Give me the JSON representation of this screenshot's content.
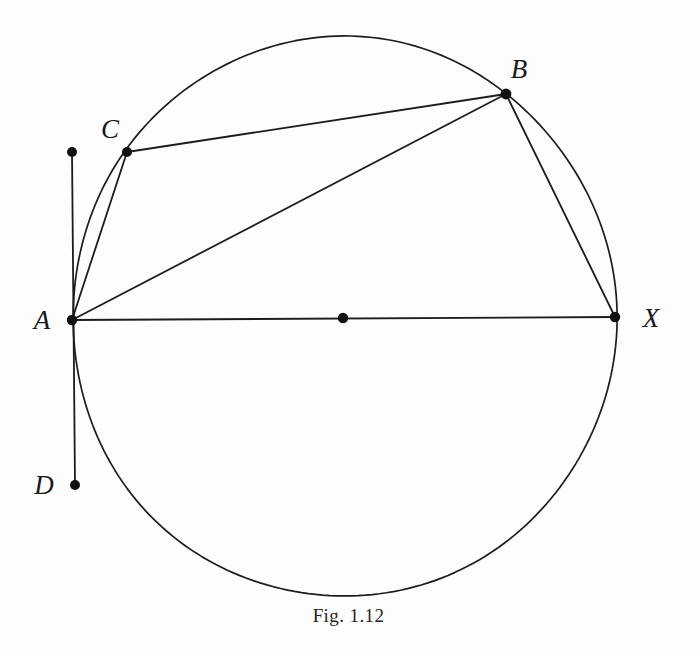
{
  "figure": {
    "caption": "Fig. 1.12",
    "caption_x": 347,
    "caption_y": 605,
    "background_color": "#fdfdfd",
    "ink_color": "#1c1c1c",
    "width": 697,
    "height": 649
  },
  "chart_data": {
    "type": "diagram",
    "title": "Fig. 1.12",
    "circle": {
      "label": "circumscribed-circle",
      "center_x": 344,
      "center_y": 317,
      "radius_x": 272,
      "radius_y": 280,
      "stroke_width": 1.7
    },
    "points": [
      {
        "id": "A",
        "label": "A",
        "x": 72,
        "y": 320,
        "label_x": 42,
        "label_y": 320,
        "dot_radius": 5.2,
        "on_circle": true
      },
      {
        "id": "C",
        "label": "C",
        "x": 127,
        "y": 152,
        "label_x": 110,
        "label_y": 129,
        "dot_radius": 5.0,
        "on_circle": true
      },
      {
        "id": "B",
        "label": "B",
        "x": 506,
        "y": 94,
        "label_x": 519,
        "label_y": 69,
        "dot_radius": 5.4,
        "on_circle": true
      },
      {
        "id": "X",
        "label": "X",
        "x": 615,
        "y": 317,
        "label_x": 651,
        "label_y": 318,
        "dot_radius": 5.2,
        "on_circle": true
      },
      {
        "id": "D",
        "label": "D",
        "x": 75,
        "y": 485,
        "label_x": 44,
        "label_y": 485,
        "dot_radius": 5.0,
        "on_circle": false
      },
      {
        "id": "T",
        "label": "",
        "x": 72,
        "y": 152,
        "label_x": 0,
        "label_y": 0,
        "dot_radius": 5.0,
        "on_circle": false
      },
      {
        "id": "O",
        "label": "",
        "x": 343,
        "y": 318,
        "label_x": 0,
        "label_y": 0,
        "dot_radius": 5.2,
        "on_circle": false
      }
    ],
    "segments": [
      {
        "id": "AX",
        "name": "diameter-a-to-x",
        "x1": 72,
        "y1": 320,
        "x2": 615,
        "y2": 317,
        "stroke_width": 1.8
      },
      {
        "id": "AB",
        "name": "chord-a-to-b",
        "x1": 72,
        "y1": 320,
        "x2": 506,
        "y2": 94,
        "stroke_width": 1.8
      },
      {
        "id": "AC",
        "name": "chord-a-to-c",
        "x1": 72,
        "y1": 320,
        "x2": 127,
        "y2": 152,
        "stroke_width": 1.8
      },
      {
        "id": "CB",
        "name": "chord-c-to-b",
        "x1": 127,
        "y1": 152,
        "x2": 506,
        "y2": 94,
        "stroke_width": 1.8
      },
      {
        "id": "BX",
        "name": "chord-b-to-x",
        "x1": 506,
        "y1": 94,
        "x2": 615,
        "y2": 317,
        "stroke_width": 1.8
      },
      {
        "id": "TD",
        "name": "tangent-line-at-a",
        "x1": 72,
        "y1": 152,
        "x2": 75,
        "y2": 485,
        "stroke_width": 1.8
      }
    ]
  }
}
